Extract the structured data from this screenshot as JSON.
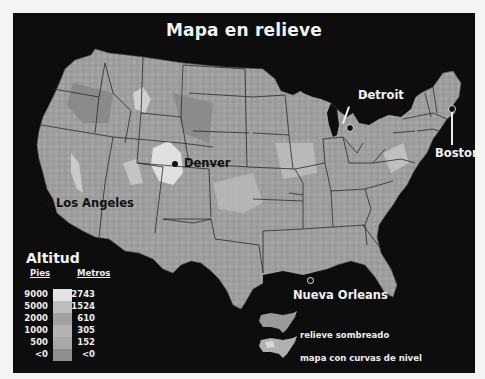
{
  "title": "Mapa en relieve",
  "cities": [
    {
      "name": "Detroit",
      "style": "light"
    },
    {
      "name": "Boston",
      "style": "light"
    },
    {
      "name": "Denver",
      "style": "dark"
    },
    {
      "name": "Los Angeles",
      "style": "dark"
    },
    {
      "name": "Nueva Orleans",
      "style": "light"
    }
  ],
  "legend": {
    "title": "Altitud",
    "feet_header": "Pies",
    "meters_header": "Metros",
    "rows": [
      {
        "feet": "9000",
        "meters": "2743",
        "color": "#e4e4e4"
      },
      {
        "feet": "5000",
        "meters": "1524",
        "color": "#bdbdbd"
      },
      {
        "feet": "2000",
        "meters": "610",
        "color": "#a2a2a2"
      },
      {
        "feet": "1000",
        "meters": "305",
        "color": "#b4b4b4"
      },
      {
        "feet": "500",
        "meters": "152",
        "color": "#a8a8a8"
      },
      {
        "feet": "<0",
        "meters": "<0",
        "color": "#8e8e8e"
      }
    ]
  },
  "map_key": [
    {
      "label": "relieve sombreado"
    },
    {
      "label": "mapa con curvas de nivel"
    }
  ],
  "colors": {
    "background": "#0d0d0d",
    "land_base": "#9d9d9d",
    "border": "#2a2a2a",
    "text_light": "#f2f2f2"
  }
}
